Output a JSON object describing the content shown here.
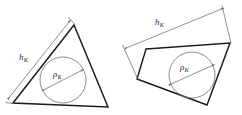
{
  "figure": {
    "background_color": "#ffffff",
    "edge_color": "#1b1b1b",
    "circle_color": "#6d6d6d",
    "dimension_color": "#6a6a6a",
    "label_color": "#2a2a2a",
    "width": 242,
    "height": 115,
    "panels": [
      {
        "id": "triangle-panel",
        "shape_name": "triangle",
        "shape_points": "13,103 74,25 108,107",
        "incircle": {
          "cx": 63,
          "cy": 80,
          "r": 23
        },
        "diameter_arrow": {
          "x1": 42.5,
          "y1": 90.5,
          "x2": 83.5,
          "y2": 69.5
        },
        "height_arrow": {
          "x1": 8,
          "y1": 99,
          "x2": 70.5,
          "y2": 20
        },
        "height_label": {
          "symbol": "h",
          "subscript": "K"
        },
        "radius_label": {
          "symbol": "ρ",
          "subscript": "K"
        }
      },
      {
        "id": "quadrilateral-panel",
        "shape_name": "quadrilateral",
        "shape_points": "146,49 230,43 207,105 137,79",
        "incircle": {
          "cx": 192,
          "cy": 75,
          "r": 23
        },
        "diameter_arrow": {
          "x1": 169,
          "y1": 85,
          "x2": 214.5,
          "y2": 64.5
        },
        "height_arrow": {
          "x1": 125,
          "y1": 48.5,
          "x2": 224,
          "y2": 8
        },
        "height_label": {
          "symbol": "h",
          "subscript": "K"
        },
        "radius_label": {
          "symbol": "ρ",
          "subscript": "K"
        }
      }
    ]
  },
  "labels": {
    "left_height": {
      "symbol": "h",
      "subscript": "K"
    },
    "left_radius": {
      "symbol": "ρ",
      "subscript": "K"
    },
    "right_height": {
      "symbol": "h",
      "subscript": "K"
    },
    "right_radius": {
      "symbol": "ρ",
      "subscript": "K"
    }
  }
}
